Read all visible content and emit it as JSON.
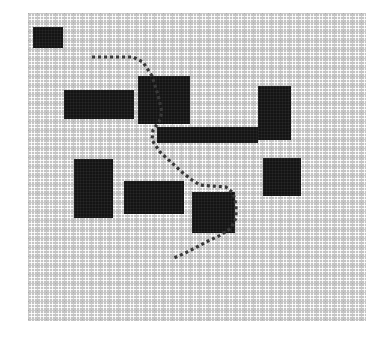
{
  "scene": {
    "title": "Occupancy Grid Path Plan",
    "grid": {
      "origin_x": 28,
      "origin_y": 13,
      "width": 338,
      "height": 308,
      "cell_size": 3,
      "free_color": "#c3c3c3",
      "line_color": "#ffffff",
      "occupied_color": "#141414"
    },
    "path": {
      "name": "planned-path",
      "style": "dotted",
      "color": "#3a3a3a",
      "dash": "3 3",
      "points": [
        {
          "x": 92,
          "y": 57
        },
        {
          "x": 133,
          "y": 57
        },
        {
          "x": 143,
          "y": 62
        },
        {
          "x": 152,
          "y": 76
        },
        {
          "x": 158,
          "y": 95
        },
        {
          "x": 162,
          "y": 112
        },
        {
          "x": 159,
          "y": 122
        },
        {
          "x": 153,
          "y": 130
        },
        {
          "x": 152,
          "y": 140
        },
        {
          "x": 160,
          "y": 152
        },
        {
          "x": 172,
          "y": 163
        },
        {
          "x": 183,
          "y": 173
        },
        {
          "x": 192,
          "y": 180
        },
        {
          "x": 200,
          "y": 185
        },
        {
          "x": 212,
          "y": 186
        },
        {
          "x": 226,
          "y": 187
        },
        {
          "x": 233,
          "y": 193
        },
        {
          "x": 236,
          "y": 205
        },
        {
          "x": 236,
          "y": 218
        },
        {
          "x": 231,
          "y": 228
        },
        {
          "x": 221,
          "y": 235
        },
        {
          "x": 208,
          "y": 241
        },
        {
          "x": 195,
          "y": 248
        },
        {
          "x": 183,
          "y": 254
        },
        {
          "x": 174,
          "y": 258
        }
      ]
    },
    "obstacles": [
      {
        "name": "obstacle-top-left-start-block",
        "x": 33,
        "y": 27,
        "w": 30,
        "h": 21
      },
      {
        "name": "obstacle-left-wide-block",
        "x": 64,
        "y": 90,
        "w": 70,
        "h": 29
      },
      {
        "name": "obstacle-center-large-block",
        "x": 138,
        "y": 76,
        "w": 52,
        "h": 48
      },
      {
        "name": "obstacle-right-tall-block",
        "x": 258,
        "y": 86,
        "w": 33,
        "h": 54
      },
      {
        "name": "obstacle-center-wall-bar",
        "x": 157,
        "y": 127,
        "w": 101,
        "h": 16
      },
      {
        "name": "obstacle-lower-left-tall-block",
        "x": 74,
        "y": 159,
        "w": 39,
        "h": 59
      },
      {
        "name": "obstacle-lower-mid-wide-block",
        "x": 124,
        "y": 181,
        "w": 60,
        "h": 33
      },
      {
        "name": "obstacle-goal-adjacent-block",
        "x": 192,
        "y": 192,
        "w": 43,
        "h": 41
      },
      {
        "name": "obstacle-right-mid-block",
        "x": 263,
        "y": 158,
        "w": 38,
        "h": 38
      }
    ]
  }
}
